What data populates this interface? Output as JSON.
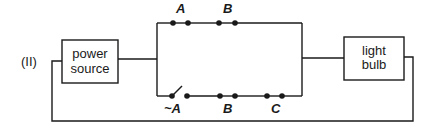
{
  "figure_label": "(II)",
  "components": {
    "power_source": {
      "line1": "power",
      "line2": "source"
    },
    "light_bulb": {
      "line1": "light",
      "line2": "bulb"
    }
  },
  "top_branch": {
    "switches": [
      {
        "label": "A",
        "state": "closed"
      },
      {
        "label": "B",
        "state": "closed"
      }
    ]
  },
  "bottom_branch": {
    "switches": [
      {
        "label": "~A",
        "state": "open"
      },
      {
        "label": "B",
        "state": "closed"
      },
      {
        "label": "C",
        "state": "closed"
      }
    ]
  }
}
